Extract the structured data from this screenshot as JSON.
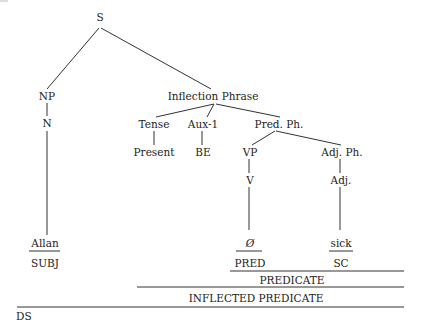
{
  "diagram": {
    "type": "syntax-tree",
    "nodes": {
      "s": "S",
      "np": "NP",
      "n": "N",
      "inflection_phrase": "Inflection Phrase",
      "tense": "Tense",
      "aux1": "Aux-1",
      "pred_ph": "Pred. Ph.",
      "present": "Present",
      "be": "BE",
      "vp": "VP",
      "adj_ph": "Adj. Ph.",
      "v": "V",
      "adj": "Adj."
    },
    "leaves": {
      "allan": "Allan",
      "null": "Ø",
      "sick": "sick"
    },
    "functions": {
      "subj": "SUBJ",
      "pred": "PRED",
      "sc": "SC"
    },
    "spans": {
      "predicate": "PREDICATE",
      "inflected_predicate": "INFLECTED PREDICATE"
    },
    "structure_label": "DS"
  }
}
